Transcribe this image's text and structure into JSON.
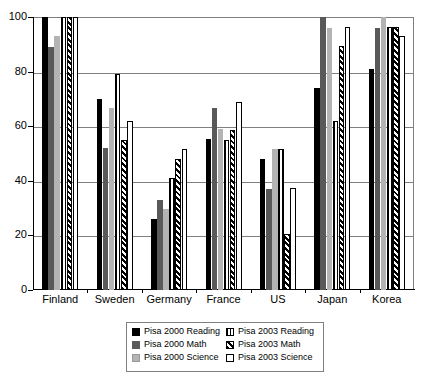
{
  "chart_data": {
    "type": "bar",
    "title": "",
    "subtitle": "",
    "xlabel": "",
    "ylabel": "",
    "ylim": [
      0,
      100
    ],
    "yticks": [
      0,
      20,
      40,
      60,
      80,
      100
    ],
    "grid": true,
    "legend_position": "bottom",
    "categories": [
      "Finland",
      "Sweden",
      "Germany",
      "France",
      "US",
      "Japan",
      "Korea"
    ],
    "series": [
      {
        "name": "Pisa 2000 Reading",
        "style": "solid-black",
        "color": "#000000",
        "values": [
          100,
          70,
          26,
          55.5,
          48,
          74,
          81
        ]
      },
      {
        "name": "Pisa 2000 Math",
        "style": "solid-dark-grey",
        "color": "#595959",
        "values": [
          89,
          52,
          33,
          66.5,
          37,
          100,
          96
        ]
      },
      {
        "name": "Pisa 2000 Science",
        "style": "solid-light-grey",
        "color": "#b3b3b3",
        "values": [
          93,
          66.5,
          29.5,
          59,
          51.5,
          96,
          100
        ]
      },
      {
        "name": "Pisa 2003 Reading",
        "style": "vertical-stripes",
        "color": "#000000",
        "values": [
          100,
          79,
          41,
          55,
          51.5,
          62,
          96.5
        ]
      },
      {
        "name": "Pisa 2003 Math",
        "style": "diagonal-hatch",
        "color": "#000000",
        "values": [
          100,
          55,
          48,
          58.5,
          20.5,
          89.5,
          96.5
        ]
      },
      {
        "name": "Pisa 2003 Science",
        "style": "white-outline",
        "color": "#ffffff",
        "values": [
          100,
          62,
          51.5,
          69,
          37.5,
          96.5,
          93
        ]
      }
    ]
  },
  "axis": {
    "y_tick_labels": [
      "100",
      "80",
      "60",
      "40",
      "20",
      "0"
    ]
  },
  "legend": {
    "column_left": [
      "Pisa 2000 Reading",
      "Pisa 2000 Math",
      "Pisa 2000 Science"
    ],
    "column_right": [
      "Pisa 2003 Reading",
      "Pisa 2003 Math",
      "Pisa 2003 Science"
    ]
  }
}
